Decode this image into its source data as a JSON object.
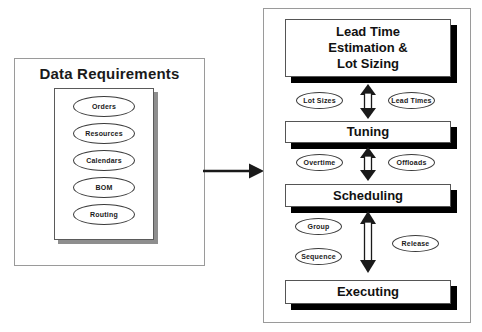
{
  "diagram": {
    "left_panel": {
      "title": "Data Requirements",
      "document_items": [
        {
          "label": "Orders"
        },
        {
          "label": "Resources"
        },
        {
          "label": "Calendars"
        },
        {
          "label": "BOM"
        },
        {
          "label": "Routing"
        }
      ]
    },
    "connector": {
      "name": "feeds-into-arrow",
      "direction": "right"
    },
    "right_panel": {
      "stages": [
        {
          "id": "lead-time",
          "label_lines": [
            "Lead Time",
            "Estimation &",
            "Lot Sizing"
          ]
        },
        {
          "id": "tuning",
          "label_lines": [
            "Tuning"
          ]
        },
        {
          "id": "scheduling",
          "label_lines": [
            "Scheduling"
          ]
        },
        {
          "id": "executing",
          "label_lines": [
            "Executing"
          ]
        }
      ],
      "connector_groups": [
        {
          "id": "lead-to-tuning",
          "arrow": "double-headed-vertical",
          "left_label": "Lot Sizes",
          "right_label": "Lead Times"
        },
        {
          "id": "tuning-to-scheduling",
          "arrow": "double-headed-vertical",
          "left_label": "Overtime",
          "right_label": "Offloads"
        },
        {
          "id": "scheduling-to-executing",
          "arrow": "double-headed-vertical",
          "left_label_top": "Group",
          "left_label_bottom": "Sequence",
          "right_label": "Release"
        }
      ]
    },
    "colors": {
      "panel_border": "#9a9a9a",
      "box_face": "#ffffff",
      "box_shadow": "#000000",
      "doc_shadow": "#8e8e8e",
      "text": "#111111",
      "arrow": "#1a1a1a"
    }
  }
}
